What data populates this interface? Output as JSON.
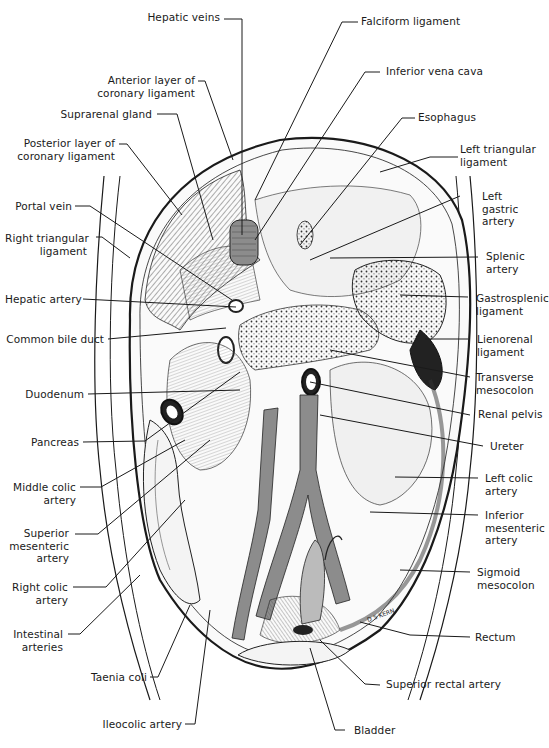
{
  "figure": {
    "signature": "D S KERN",
    "colors": {
      "ink": "#1a1a1a",
      "vessel": "#8c8c8c",
      "background": "#ffffff"
    }
  },
  "labels": {
    "hepatic_veins": "Hepatic veins",
    "falciform_ligament": "Falciform ligament",
    "anterior_layer_coronary": "Anterior layer of\ncoronary ligament",
    "inferior_vena_cava": "Inferior vena cava",
    "suprarenal_gland": "Suprarenal gland",
    "esophagus": "Esophagus",
    "posterior_layer_coronary": "Posterior layer of\ncoronary ligament",
    "left_triangular_ligament": "Left triangular\nligament",
    "portal_vein": "Portal vein",
    "left_gastric_artery": "Left\ngastric\nartery",
    "right_triangular_ligament": "Right triangular\nligament",
    "splenic_artery": "Splenic\nartery",
    "hepatic_artery": "Hepatic artery",
    "gastrosplenic_ligament": "Gastrosplenic\nligament",
    "common_bile_duct": "Common bile duct",
    "lienorenal_ligament": "Lienorenal\nligament",
    "transverse_mesocolon": "Transverse\nmesocolon",
    "duodenum": "Duodenum",
    "renal_pelvis": "Renal pelvis",
    "pancreas": "Pancreas",
    "ureter": "Ureter",
    "middle_colic_artery": "Middle colic\nartery",
    "left_colic_artery": "Left colic\nartery",
    "superior_mesenteric_artery": "Superior\nmesenteric\nartery",
    "inferior_mesenteric_artery": "Inferior\nmesenteric\nartery",
    "right_colic_artery": "Right colic\nartery",
    "sigmoid_mesocolon": "Sigmoid\nmesocolon",
    "intestinal_arteries": "Intestinal\narteries",
    "rectum": "Rectum",
    "taenia_coli": "Taenia coli",
    "superior_rectal_artery": "Superior rectal artery",
    "ileocolic_artery": "Ileocolic artery",
    "bladder": "Bladder"
  }
}
